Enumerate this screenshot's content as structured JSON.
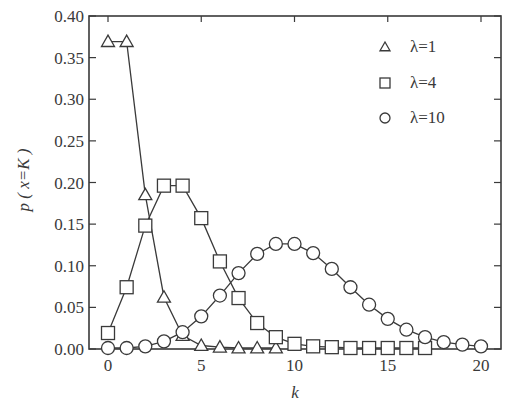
{
  "chart_data": {
    "type": "line",
    "title": "",
    "xlabel": "k",
    "ylabel": "p ( x=K )",
    "xlim": [
      -1,
      21
    ],
    "ylim": [
      0,
      0.4
    ],
    "xticks": [
      0,
      5,
      10,
      15,
      20
    ],
    "xtick_labels": [
      "0",
      "5",
      "10",
      "15",
      "20"
    ],
    "yticks": [
      0.0,
      0.05,
      0.1,
      0.15,
      0.2,
      0.25,
      0.3,
      0.35,
      0.4
    ],
    "ytick_labels": [
      "0.00",
      "0.05",
      "0.10",
      "0.15",
      "0.20",
      "0.25",
      "0.30",
      "0.35",
      "0.40"
    ],
    "grid": false,
    "legend_position": "upper right",
    "series": [
      {
        "name": "λ=1",
        "marker": "triangle",
        "x": [
          0,
          1,
          2,
          3,
          4,
          5,
          6,
          7,
          8,
          9
        ],
        "values": [
          0.368,
          0.368,
          0.184,
          0.061,
          0.015,
          0.003,
          0.001,
          0.0,
          0.0,
          0.0
        ]
      },
      {
        "name": "λ=4",
        "marker": "square",
        "x": [
          0,
          1,
          2,
          3,
          4,
          5,
          6,
          7,
          8,
          9,
          10,
          11,
          12,
          13,
          14,
          15,
          16,
          17
        ],
        "values": [
          0.018,
          0.073,
          0.147,
          0.195,
          0.195,
          0.156,
          0.104,
          0.06,
          0.03,
          0.013,
          0.005,
          0.002,
          0.001,
          0.0,
          0.0,
          0.0,
          0.0,
          0.0
        ]
      },
      {
        "name": "λ=10",
        "marker": "circle",
        "x": [
          0,
          1,
          2,
          3,
          4,
          5,
          6,
          7,
          8,
          9,
          10,
          11,
          12,
          13,
          14,
          15,
          16,
          17,
          18,
          19,
          20
        ],
        "values": [
          0.0,
          0.0,
          0.002,
          0.008,
          0.019,
          0.038,
          0.063,
          0.09,
          0.113,
          0.125,
          0.125,
          0.114,
          0.095,
          0.073,
          0.052,
          0.035,
          0.022,
          0.013,
          0.007,
          0.004,
          0.002
        ]
      }
    ]
  }
}
